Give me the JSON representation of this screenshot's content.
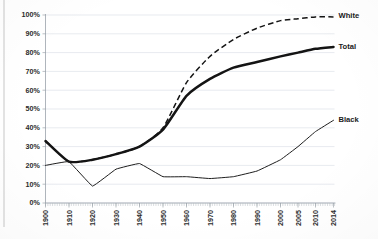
{
  "chart_data": {
    "type": "line",
    "title": "",
    "subtitle": "",
    "xlabel": "",
    "ylabel": "",
    "ylim": [
      0,
      100
    ],
    "ytick_labels": [
      "0%",
      "10%",
      "20%",
      "30%",
      "40%",
      "50%",
      "60%",
      "70%",
      "80%",
      "90%",
      "100%"
    ],
    "ytick_values": [
      0,
      10,
      20,
      30,
      40,
      50,
      60,
      70,
      80,
      90,
      100
    ],
    "grid": "horizontal",
    "legend_position": "right-of-line-ends",
    "categories": [
      "1900",
      "1910",
      "1920",
      "1930",
      "1940",
      "1950",
      "1960",
      "1970",
      "1980",
      "1990",
      "2000",
      "2005",
      "2010",
      "2014"
    ],
    "x": [
      1900,
      1910,
      1920,
      1930,
      1940,
      1950,
      1960,
      1970,
      1980,
      1990,
      2000,
      2005,
      2010,
      2014
    ],
    "series": [
      {
        "name": "White",
        "style": "dashed",
        "label": "White",
        "values": [
          33,
          22,
          23,
          26,
          30,
          40,
          64,
          78,
          87,
          93,
          97,
          98,
          99,
          99
        ]
      },
      {
        "name": "Total",
        "style": "thick-solid",
        "label": "Total",
        "values": [
          33,
          22,
          23,
          26,
          30,
          39,
          57,
          66,
          72,
          75,
          78,
          80,
          82,
          83
        ]
      },
      {
        "name": "Black",
        "style": "thin-solid",
        "label": "Black",
        "values": [
          20,
          22,
          9,
          18,
          21,
          14,
          14,
          13,
          14,
          17,
          23,
          30,
          38,
          44
        ]
      }
    ],
    "annotations": [
      {
        "text": "White",
        "series": "White"
      },
      {
        "text": "Total",
        "series": "Total"
      },
      {
        "text": "Black",
        "series": "Black"
      }
    ]
  }
}
